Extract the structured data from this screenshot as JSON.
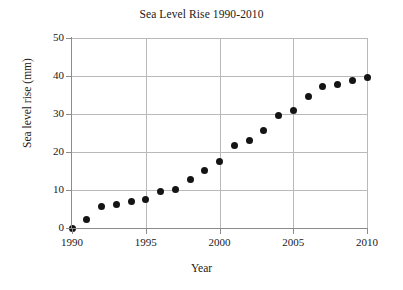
{
  "chart_data": {
    "type": "scatter",
    "title": "Sea Level Rise 1990-2010",
    "xlabel": "Year",
    "ylabel": "Sea level rise (mm)",
    "xlim": [
      1990,
      2010
    ],
    "ylim": [
      0,
      50
    ],
    "grid": true,
    "legend": null,
    "xticks": [
      "1990",
      "1995",
      "2000",
      "2005",
      "2010"
    ],
    "xtick_values": [
      1990,
      1995,
      2000,
      2005,
      2010
    ],
    "yticks": [
      "0",
      "10",
      "20",
      "30",
      "40",
      "50"
    ],
    "ytick_values": [
      0,
      10,
      20,
      30,
      40,
      50
    ],
    "marker": "filled-circle",
    "marker_color": "#141414",
    "grid_color": "#b9b9b9",
    "axis_color": "#8c8c8c",
    "background_color": "#ffffff",
    "x": [
      1990,
      1991,
      1992,
      1993,
      1994,
      1995,
      1996,
      1997,
      1998,
      1999,
      2000,
      2001,
      2002,
      2003,
      2004,
      2005,
      2006,
      2007,
      2008,
      2009,
      2010
    ],
    "values": [
      0.0,
      2.3,
      5.6,
      6.3,
      7.1,
      7.4,
      9.5,
      10.1,
      12.8,
      15.2,
      17.6,
      21.8,
      23.0,
      25.6,
      29.5,
      30.9,
      34.5,
      37.3,
      37.8,
      38.8,
      39.7
    ],
    "series": [
      {
        "name": "Sea level rise",
        "values": [
          0.0,
          2.3,
          5.6,
          6.3,
          7.1,
          7.4,
          9.5,
          10.1,
          12.8,
          15.2,
          17.6,
          21.8,
          23.0,
          25.6,
          29.5,
          30.9,
          34.5,
          37.3,
          37.8,
          38.8,
          39.7
        ]
      }
    ]
  }
}
